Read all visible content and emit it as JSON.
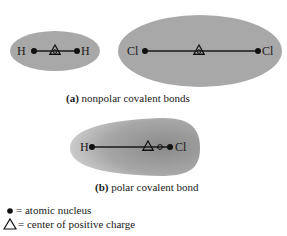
{
  "panel_a": {
    "caption_label": "(a)",
    "caption_text": " nonpolar covalent bonds",
    "molecules": [
      {
        "name": "H2",
        "left_atom": "H",
        "right_atom": "H"
      },
      {
        "name": "Cl2",
        "left_atom": "Cl",
        "right_atom": "Cl"
      }
    ]
  },
  "panel_b": {
    "caption_label": "(b)",
    "caption_text": " polar covalent bond",
    "molecule": {
      "name": "HCl",
      "left_atom": "H",
      "right_atom": "Cl"
    }
  },
  "legend": {
    "nucleus_text": "= atomic nucleus",
    "positive_charge_text": "= center of positive charge"
  },
  "colors": {
    "cloud_gray": "#a8a8a8",
    "cloud_dark": "#8e8e8e",
    "ink": "#1a1a1a"
  }
}
